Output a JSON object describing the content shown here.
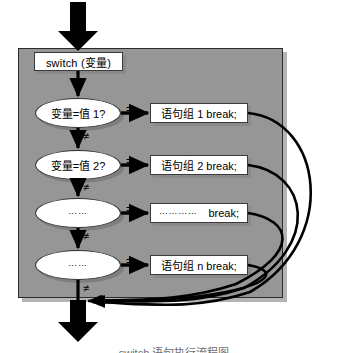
{
  "figure": {
    "kind": "flowchart",
    "title_caption": "switch 语句执行流程图",
    "panel_color": "#969696",
    "node_fill": "#ffffff",
    "line_color": "#000000"
  },
  "entry": {
    "arrow_name": "entry-arrow"
  },
  "switch_node": {
    "label": "switch (变量)"
  },
  "branches": [
    {
      "condition": "变量=值 1?",
      "equal_label": "=",
      "not_equal_label": "≠",
      "statement": "语句组 1 break;"
    },
    {
      "condition": "变量=值 2?",
      "equal_label": "=",
      "not_equal_label": "≠",
      "statement": "语句组 2 break;"
    },
    {
      "condition": "……",
      "equal_label": "=",
      "not_equal_label": "≠",
      "statement_dots": "…………",
      "statement": "break;"
    },
    {
      "condition": "……",
      "equal_label": "=",
      "not_equal_label": "≠",
      "statement": "语句组 n break;"
    }
  ],
  "exit": {
    "arrow_name": "exit-arrow"
  },
  "caption": {
    "text": "switch 语句执行流程图"
  }
}
